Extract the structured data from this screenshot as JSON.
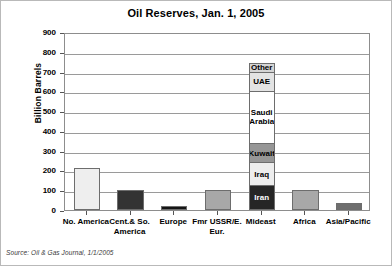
{
  "chart_data": {
    "type": "bar",
    "title": "Oil Reserves, Jan. 1, 2005",
    "xlabel": "",
    "ylabel": "Billion Barrels",
    "ylim": [
      0,
      900
    ],
    "yticks": [
      900,
      800,
      700,
      600,
      500,
      400,
      300,
      200,
      100,
      0
    ],
    "grid": true,
    "legend": "none",
    "categories": [
      "No. America",
      "Cent.& So. America",
      "Europe",
      "Fmr USSR/E. Eur.",
      "Mideast",
      "Africa",
      "Asia/Pacific"
    ],
    "values": [
      210,
      101,
      18,
      100,
      742,
      101,
      37
    ],
    "stacked_category": "Mideast",
    "stacked_segments": [
      {
        "name": "Iran",
        "value": 126,
        "color": "#262626",
        "text_color": "#ffffff"
      },
      {
        "name": "Iraq",
        "value": 115,
        "color": "#ededed",
        "text_color": "#000000"
      },
      {
        "name": "Kuwait",
        "value": 99,
        "color": "#969696",
        "text_color": "#000000"
      },
      {
        "name": "Saudi Arabia",
        "value": 262,
        "color": "#ffffff",
        "text_color": "#000000"
      },
      {
        "name": "UAE",
        "value": 98,
        "color": "#e3e3e3",
        "text_color": "#000000"
      },
      {
        "name": "Other",
        "value": 42,
        "color": "#d4d4d4",
        "text_color": "#000000"
      }
    ],
    "bar_colors": [
      "#eeeeee",
      "#333333",
      "#151515",
      "#a8a8a8",
      "#ffffff",
      "#a8a8a8",
      "#6e6e6e"
    ],
    "annotations": [
      "Source: Oil & Gas Journal, 1/1/2005"
    ]
  },
  "source_note": "Source: Oil & Gas Journal, 1/1/2005"
}
